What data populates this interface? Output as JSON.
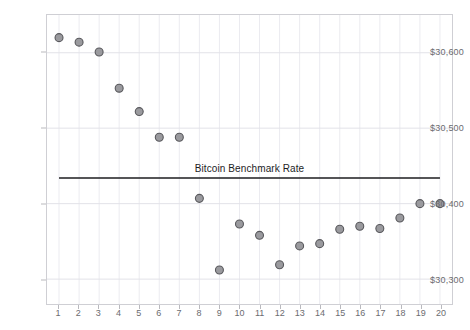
{
  "chart_data": {
    "type": "scatter",
    "title": "",
    "subtitle": "",
    "xlabel": "",
    "ylabel": "",
    "x": [
      1,
      2,
      3,
      4,
      5,
      6,
      7,
      8,
      9,
      10,
      11,
      12,
      13,
      14,
      15,
      16,
      17,
      18,
      19,
      20
    ],
    "values": [
      30620,
      30614,
      30601,
      30553,
      30522,
      30488,
      30488,
      30407,
      30312,
      30373,
      30358,
      30319,
      30344,
      30347,
      30366,
      30370,
      30367,
      30381,
      30400,
      30400
    ],
    "series": [
      {
        "name": "Bitcoin Price",
        "values": [
          30620,
          30614,
          30601,
          30553,
          30522,
          30488,
          30488,
          30407,
          30312,
          30373,
          30358,
          30319,
          30344,
          30347,
          30366,
          30370,
          30367,
          30381,
          30400,
          30400
        ],
        "marker_fill": "#9a9a9e",
        "marker_stroke": "#58585c"
      }
    ],
    "annotations": [
      {
        "type": "hline",
        "label": "Bitcoin Benchmark Rate",
        "value": 30434,
        "color": "#1d1d1f",
        "x_start": 1,
        "x_end": 20
      }
    ],
    "ylim": [
      30267,
      30650
    ],
    "xlim": [
      0.4,
      20.6
    ],
    "yticks": [
      30300,
      30400,
      30500,
      30600
    ],
    "ytick_labels": [
      "$30,300",
      "$30,400",
      "$30,500",
      "$30,600"
    ],
    "xticks": [
      1,
      2,
      3,
      4,
      5,
      6,
      7,
      8,
      9,
      10,
      11,
      12,
      13,
      14,
      15,
      16,
      17,
      18,
      19,
      20
    ],
    "xtick_labels": [
      "1",
      "2",
      "3",
      "4",
      "5",
      "6",
      "7",
      "8",
      "9",
      "10",
      "11",
      "12",
      "13",
      "14",
      "15",
      "16",
      "17",
      "18",
      "19",
      "20"
    ],
    "grid": true,
    "grid_color": "#ebebf0",
    "legend": false,
    "legend_position": "none",
    "plot_background": "#ffffff",
    "frame_color": "#cfcfd4"
  }
}
